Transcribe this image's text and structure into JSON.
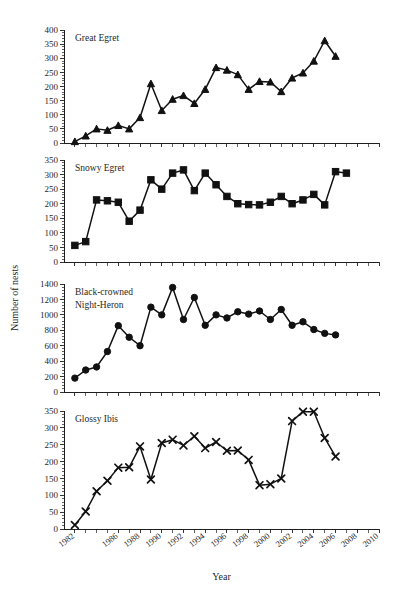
{
  "figure": {
    "axis_title_y": "Number of nests",
    "axis_title_x": "Year"
  },
  "chart_data": {
    "type": "line",
    "title": "",
    "xlabel": "Year",
    "ylabel": "Number of nests",
    "grid": false,
    "legend": "none",
    "xlim": [
      1981,
      2010
    ],
    "x_tick_labels": [
      "1982",
      "1986",
      "1988",
      "1990",
      "1992",
      "1994",
      "1996",
      "1998",
      "2000",
      "2002",
      "2004",
      "2006",
      "2008",
      "2010"
    ],
    "x_tick_values": [
      1982,
      1986,
      1988,
      1990,
      1992,
      1994,
      1996,
      1998,
      2000,
      2002,
      2004,
      2006,
      2008,
      2010
    ],
    "x_minor_step": 1,
    "panels": [
      {
        "name": "Great Egret",
        "marker": "triangle",
        "ylim": [
          0,
          400
        ],
        "y_tick_step": 50,
        "y_tick_labels": [
          "0",
          "50",
          "100",
          "150",
          "200",
          "250",
          "300",
          "350",
          "400"
        ],
        "x": [
          1982,
          1983,
          1984,
          1985,
          1986,
          1987,
          1988,
          1989,
          1990,
          1991,
          1992,
          1993,
          1994,
          1995,
          1996,
          1997,
          1998,
          1999,
          2000,
          2001,
          2002,
          2003,
          2004,
          2005,
          2006,
          2007,
          2008
        ],
        "values": [
          5,
          25,
          50,
          45,
          62,
          50,
          90,
          210,
          115,
          155,
          168,
          140,
          190,
          267,
          258,
          242,
          190,
          218,
          216,
          182,
          230,
          248,
          290,
          362,
          307
        ]
      },
      {
        "name": "Snowy Egret",
        "marker": "square",
        "ylim": [
          0,
          350
        ],
        "y_tick_step": 50,
        "y_tick_labels": [
          "0",
          "50",
          "100",
          "150",
          "200",
          "250",
          "300",
          "350"
        ],
        "x": [
          1982,
          1983,
          1984,
          1985,
          1986,
          1987,
          1988,
          1989,
          1990,
          1991,
          1992,
          1993,
          1994,
          1995,
          1996,
          1997,
          1998,
          1999,
          2000,
          2001,
          2002,
          2003,
          2004,
          2005,
          2006,
          2007,
          2008
        ],
        "values": [
          57,
          70,
          213,
          210,
          205,
          140,
          178,
          282,
          250,
          305,
          316,
          245,
          305,
          265,
          225,
          200,
          197,
          196,
          205,
          225,
          200,
          213,
          232,
          196,
          310,
          305
        ]
      },
      {
        "name": "Black-crowned Night-Heron",
        "name_line1": "Black-crowned",
        "name_line2": "Night-Heron",
        "marker": "circle",
        "ylim": [
          0,
          1400
        ],
        "y_tick_step": 200,
        "y_tick_labels": [
          "0",
          "200",
          "400",
          "600",
          "800",
          "1000",
          "1200",
          "1400"
        ],
        "x": [
          1982,
          1983,
          1984,
          1985,
          1986,
          1987,
          1988,
          1989,
          1990,
          1991,
          1992,
          1993,
          1994,
          1995,
          1996,
          1997,
          1998,
          1999,
          2000,
          2001,
          2002,
          2003,
          2004,
          2005,
          2006,
          2007,
          2008
        ],
        "values": [
          180,
          285,
          325,
          525,
          860,
          710,
          600,
          1100,
          1000,
          1355,
          940,
          1225,
          865,
          1000,
          960,
          1040,
          1010,
          1050,
          940,
          1070,
          865,
          910,
          810,
          760,
          740
        ]
      },
      {
        "name": "Glossy Ibis",
        "marker": "cross",
        "ylim": [
          0,
          350
        ],
        "y_tick_step": 50,
        "y_tick_labels": [
          "0",
          "50",
          "100",
          "150",
          "200",
          "250",
          "300",
          "350"
        ],
        "x": [
          1982,
          1983,
          1984,
          1985,
          1986,
          1987,
          1988,
          1989,
          1990,
          1991,
          1992,
          1993,
          1994,
          1995,
          1996,
          1997,
          1998,
          1999,
          2000,
          2001,
          2002,
          2003,
          2004,
          2005,
          2006,
          2007,
          2008
        ],
        "values": [
          12,
          52,
          112,
          143,
          182,
          183,
          245,
          147,
          255,
          265,
          248,
          275,
          240,
          258,
          232,
          233,
          205,
          130,
          133,
          150,
          320,
          348,
          348,
          270,
          215
        ]
      }
    ]
  }
}
